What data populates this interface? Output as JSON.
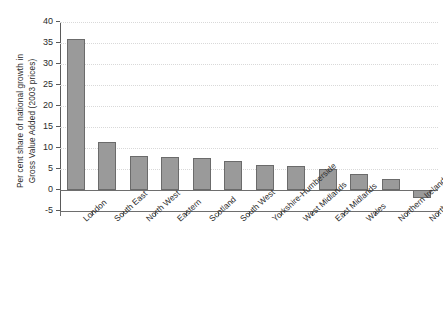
{
  "chart_data": {
    "type": "bar",
    "title": "",
    "xlabel": "",
    "ylabel": "Per cent share of national growth in\nGross Value Added (2003 prices)",
    "ylim": [
      -5,
      40
    ],
    "ytick_step": 5,
    "yticks": [
      40,
      35,
      30,
      25,
      20,
      15,
      10,
      5,
      0,
      -5
    ],
    "ytick_labels": [
      "40",
      "35",
      "30",
      "25",
      "20",
      "15",
      "10",
      "5",
      "0",
      "-5"
    ],
    "grid": "horizontal-dotted",
    "legend": "none",
    "bar_color": "#9a9a9a",
    "bar_edge_color": "#6b6b6b",
    "categories": [
      "London",
      "South East",
      "North West",
      "Eastern",
      "Scotland",
      "South West",
      "Yorkshire-Humberside",
      "West Midlands",
      "East Midlands",
      "Wales",
      "Northern Ireland",
      "North East"
    ],
    "values": [
      36.0,
      11.5,
      8.0,
      7.9,
      7.7,
      7.0,
      6.0,
      5.8,
      4.9,
      3.8,
      2.6,
      -1.8
    ]
  }
}
